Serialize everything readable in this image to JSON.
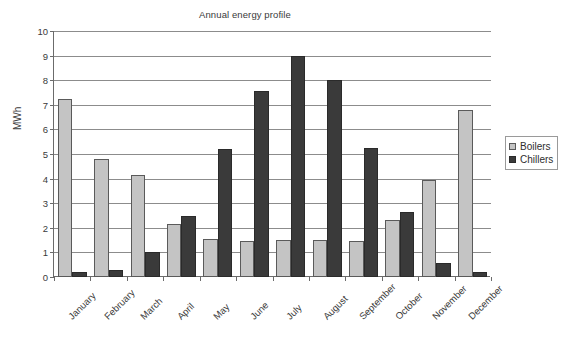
{
  "chart_data": {
    "type": "bar",
    "title": "Annual energy profile",
    "xlabel": "",
    "ylabel": "MWh",
    "ylim": [
      0,
      10
    ],
    "ytick_step": 1,
    "yticks": [
      "10",
      "9",
      "8",
      "7",
      "6",
      "5",
      "4",
      "3",
      "2",
      "1",
      "0"
    ],
    "grid": true,
    "legend_position": "right",
    "categories": [
      "January",
      "February",
      "March",
      "April",
      "May",
      "June",
      "July",
      "August",
      "September",
      "October",
      "November",
      "December"
    ],
    "series": [
      {
        "name": "Boilers",
        "color": "#c4c4c4",
        "values": [
          7.25,
          4.8,
          4.15,
          2.15,
          1.55,
          1.45,
          1.5,
          1.5,
          1.45,
          2.3,
          3.95,
          6.8
        ]
      },
      {
        "name": "Chillers",
        "color": "#3a3a3a",
        "values": [
          0.2,
          0.3,
          1.0,
          2.5,
          5.2,
          7.55,
          9.0,
          8.0,
          5.25,
          2.65,
          0.55,
          0.2
        ]
      }
    ]
  }
}
